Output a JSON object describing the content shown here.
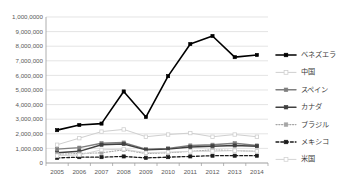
{
  "chart_data": {
    "type": "line",
    "title": "",
    "xlabel": "",
    "ylabel": "",
    "ylim": [
      0,
      10000000
    ],
    "ytick_step": 1000000,
    "grid": true,
    "legend_position": "right",
    "categories": [
      "2005",
      "2006",
      "2007",
      "2008",
      "2009",
      "2010",
      "2011",
      "2012",
      "2013",
      "2014"
    ],
    "ytick_labels": [
      "0",
      "1,000,000",
      "2,000,000",
      "3,000,000",
      "4,000,000",
      "5,000,000",
      "6,000,000",
      "7,000,000",
      "8,000,000",
      "9,000,000",
      "1,000,0000"
    ],
    "series": [
      {
        "name": "ベネズエラ",
        "color": "#000000",
        "style": "solid",
        "marker": "filled-square",
        "width": 1.6,
        "values": [
          2250000,
          2600000,
          2700000,
          4900000,
          3150000,
          5950000,
          8150000,
          8700000,
          7250000,
          7400000
        ]
      },
      {
        "name": "中国",
        "color": "#cfcfcf",
        "style": "solid",
        "marker": "open-square",
        "width": 1.0,
        "values": [
          1250000,
          1700000,
          2150000,
          2300000,
          1800000,
          1950000,
          2050000,
          1800000,
          1950000,
          1800000
        ]
      },
      {
        "name": "スペイン",
        "color": "#7f7f7f",
        "style": "solid",
        "marker": "filled-square",
        "width": 1.4,
        "values": [
          950000,
          1050000,
          1350000,
          1400000,
          950000,
          1000000,
          1200000,
          1250000,
          1350000,
          1200000
        ]
      },
      {
        "name": "カナダ",
        "color": "#404040",
        "style": "solid",
        "marker": "filled-square",
        "width": 1.4,
        "values": [
          700000,
          800000,
          1250000,
          1300000,
          900000,
          950000,
          1100000,
          1150000,
          1200000,
          1150000
        ]
      },
      {
        "name": "ブラジル",
        "color": "#a6a6a6",
        "style": "dotted",
        "marker": "filled-square",
        "width": 1.1,
        "values": [
          600000,
          650000,
          700000,
          900000,
          650000,
          700000,
          800000,
          900000,
          850000,
          800000
        ]
      },
      {
        "name": "メキシコ",
        "color": "#1a1a1a",
        "style": "dashed",
        "marker": "filled-square",
        "width": 1.3,
        "values": [
          350000,
          400000,
          400000,
          450000,
          350000,
          400000,
          450000,
          500000,
          500000,
          500000
        ]
      },
      {
        "name": "米国",
        "color": "#d4d4d4",
        "style": "solid",
        "marker": "open-square",
        "width": 1.0,
        "values": [
          500000,
          550000,
          900000,
          950000,
          700000,
          750000,
          800000,
          800000,
          850000,
          800000
        ]
      }
    ]
  }
}
